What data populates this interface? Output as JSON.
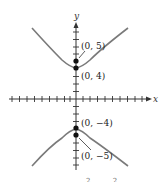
{
  "figure": {
    "axes": {
      "x_label": "x",
      "y_label": "y",
      "origin_px": [
        76,
        99
      ],
      "unit_px": 7.4,
      "x_ticks": [
        -9,
        -8,
        -7,
        -6,
        -5,
        -4,
        -3,
        -2,
        -1,
        1,
        2,
        3,
        4,
        5,
        6,
        7,
        8,
        9
      ],
      "y_ticks": [
        -8,
        -7,
        -6,
        -5,
        -4,
        -3,
        -2,
        -1,
        1,
        2,
        3,
        4,
        5,
        6,
        7,
        8
      ]
    },
    "curve": {
      "type": "hyperbola",
      "orientation": "vertical",
      "center": [
        0,
        0
      ],
      "vertices": [
        [
          0,
          4
        ],
        [
          0,
          -4
        ]
      ],
      "foci": [
        [
          0,
          5
        ],
        [
          0,
          -5
        ]
      ],
      "color": "#7a7a7a"
    },
    "points": [
      {
        "label": "(0, 5)",
        "x": 0,
        "y": 5
      },
      {
        "label": "(0, 4)",
        "x": 0,
        "y": 4
      },
      {
        "label": "(0, −4)",
        "x": 0,
        "y": -4
      },
      {
        "label": "(0, −5)",
        "x": 0,
        "y": -5
      }
    ],
    "caption_fragment": "2          2"
  }
}
